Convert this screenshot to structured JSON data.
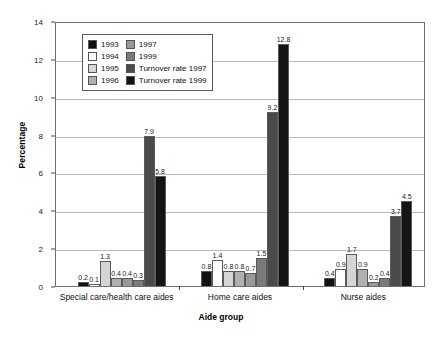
{
  "chart_data": {
    "type": "bar",
    "title": "",
    "xlabel": "Aide group",
    "ylabel": "Percentage",
    "ylim": [
      0,
      14
    ],
    "yticks": [
      0,
      2,
      4,
      6,
      8,
      10,
      12,
      14
    ],
    "ytick_labels": [
      "0",
      "2",
      "4",
      "6",
      "8",
      "10",
      "12",
      "14"
    ],
    "grid": true,
    "legend_position": "upper-left-inside",
    "categories": [
      "Special care/health care aides",
      "Home care aides",
      "Nurse aides"
    ],
    "series": [
      {
        "name": "1993",
        "color": "#111111",
        "values": [
          0.2,
          0.8,
          0.4
        ]
      },
      {
        "name": "1994",
        "color": "#ffffff",
        "values": [
          0.1,
          1.4,
          0.9
        ]
      },
      {
        "name": "1995",
        "color": "#d5d5d5",
        "values": [
          1.3,
          0.8,
          1.7
        ]
      },
      {
        "name": "1996",
        "color": "#b0b0b0",
        "values": [
          0.4,
          0.8,
          0.9
        ]
      },
      {
        "name": "1997",
        "color": "#999999",
        "values": [
          0.4,
          0.7,
          0.2
        ]
      },
      {
        "name": "1999",
        "color": "#7a7a7a",
        "values": [
          0.3,
          1.5,
          0.4
        ]
      },
      {
        "name": "Turnover rate 1997",
        "color": "#4a4a4a",
        "values": [
          7.9,
          9.2,
          3.7
        ]
      },
      {
        "name": "Turnover rate 1999",
        "color": "#141414",
        "values": [
          5.8,
          12.8,
          4.5
        ]
      }
    ],
    "value_labels": {
      "Special care/health care aides": [
        "0.2",
        "0.1",
        "1.3",
        "0.4",
        "0.4",
        "0.3",
        "7.9",
        "5.8"
      ],
      "Home care aides": [
        "0.8",
        "1.4",
        "0.8",
        "0.8",
        "0.7",
        "1.5",
        "9.2",
        "12.8"
      ],
      "Nurse aides": [
        "0.4",
        "0.9",
        "1.7",
        "0.9",
        "0.2",
        "0.4",
        "3.7",
        "4.5"
      ]
    }
  },
  "legend": {
    "columns": [
      [
        {
          "label": "1993",
          "color": "#111111"
        },
        {
          "label": "1994",
          "color": "#ffffff"
        },
        {
          "label": "1995",
          "color": "#d5d5d5"
        },
        {
          "label": "1996",
          "color": "#b0b0b0"
        }
      ],
      [
        {
          "label": "1997",
          "color": "#999999"
        },
        {
          "label": "1999",
          "color": "#7a7a7a"
        },
        {
          "label": "Turnover rate 1997",
          "color": "#4a4a4a"
        },
        {
          "label": "Turnover rate 1999",
          "color": "#141414"
        }
      ]
    ]
  }
}
